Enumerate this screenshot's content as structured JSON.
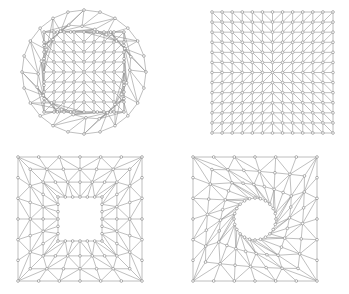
{
  "figure": {
    "title": "",
    "background_color": "#ffffff",
    "width": 349,
    "height": 294,
    "panel_count": 4
  },
  "style": {
    "edge_color": "#8a8a8a",
    "edge_width": 0.55,
    "node_stroke_color": "#909090",
    "node_fill_color": "#ffffff",
    "node_radius": 1.35,
    "node_stroke_width": 0.7,
    "boundary_color": "#7d7d7d"
  },
  "panels": [
    {
      "id": "panel-tl",
      "name": "circular-disk-mesh",
      "domain_shape": "disk",
      "hole": "none",
      "label": "",
      "viewbox": "0 0 175 147",
      "geometry": {
        "center_x": 84,
        "center_y": 72,
        "radius": 62,
        "inner_grid_half": 40,
        "inner_divisions": 8,
        "boundary_nodes": 24,
        "ring_layers": 2
      }
    },
    {
      "id": "panel-tr",
      "name": "square-criss-cross-mesh",
      "domain_shape": "square",
      "hole": "none",
      "label": "",
      "viewbox": "0 0 174 147",
      "geometry": {
        "x0": 37,
        "y0": 12,
        "size": 121,
        "divisions": 12,
        "diagonal_pattern": "union-jack-quadrant-mirrored"
      }
    },
    {
      "id": "panel-bl",
      "name": "square-with-square-hole-mesh",
      "domain_shape": "square",
      "hole": "square",
      "label": "",
      "viewbox": "0 0 175 147",
      "geometry": {
        "x0": 18,
        "y0": 10,
        "size": 124,
        "hole_half": 22,
        "radial_layers": 3,
        "circumferential_divisions": 24
      }
    },
    {
      "id": "panel-br",
      "name": "square-with-circular-hole-mesh",
      "domain_shape": "square",
      "hole": "circle",
      "label": "",
      "viewbox": "0 0 174 147",
      "geometry": {
        "x0": 18,
        "y0": 10,
        "size": 124,
        "hole_radius": 21,
        "radial_layers": 3,
        "circumferential_divisions": 24
      }
    }
  ]
}
